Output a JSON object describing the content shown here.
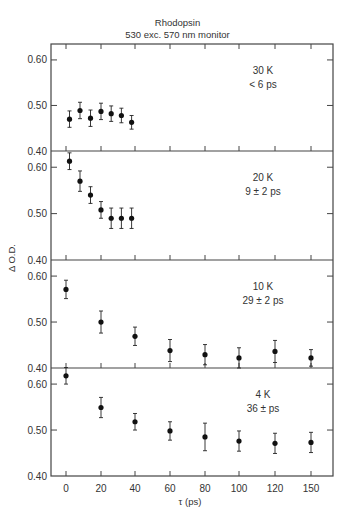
{
  "chart_data": {
    "type": "scatter",
    "title": "Rhodopsin",
    "subtitle": "530 exc. 570 nm monitor",
    "xlabel": "τ (ps)",
    "ylabel": "Δ O.D.",
    "x_ticks": [
      0,
      20,
      40,
      60,
      80,
      100,
      120,
      150
    ],
    "y_ticks": [
      "0.40",
      "0.50",
      "0.60"
    ],
    "ylim": [
      0.4,
      0.64
    ],
    "grid": false,
    "error_bars": true,
    "panels": [
      {
        "label": "30 K",
        "lifetime": "< 6 ps",
        "x": [
          2,
          8,
          14,
          20,
          26,
          32,
          38
        ],
        "y": [
          0.47,
          0.489,
          0.472,
          0.487,
          0.482,
          0.478,
          0.463
        ],
        "err": [
          0.018,
          0.018,
          0.018,
          0.018,
          0.017,
          0.016,
          0.015
        ]
      },
      {
        "label": "20 K",
        "lifetime": "9 ± 2 ps",
        "x": [
          2,
          8,
          14,
          20,
          26,
          32,
          38
        ],
        "y": [
          0.613,
          0.57,
          0.54,
          0.508,
          0.49,
          0.49,
          0.49
        ],
        "err": [
          0.018,
          0.022,
          0.018,
          0.018,
          0.022,
          0.022,
          0.022
        ]
      },
      {
        "label": "10 K",
        "lifetime": "29 ± 2 ps",
        "x": [
          0,
          20,
          40,
          60,
          80,
          100,
          120,
          150
        ],
        "y": [
          0.571,
          0.5,
          0.469,
          0.438,
          0.429,
          0.422,
          0.436,
          0.422
        ],
        "err": [
          0.02,
          0.024,
          0.02,
          0.024,
          0.022,
          0.022,
          0.024,
          0.018
        ]
      },
      {
        "label": "4 K",
        "lifetime": "36 ± ps",
        "x": [
          0,
          20,
          40,
          60,
          80,
          100,
          120,
          150
        ],
        "y": [
          0.618,
          0.549,
          0.518,
          0.498,
          0.485,
          0.476,
          0.471,
          0.473
        ],
        "err": [
          0.018,
          0.022,
          0.018,
          0.02,
          0.03,
          0.022,
          0.022,
          0.022
        ]
      }
    ]
  }
}
